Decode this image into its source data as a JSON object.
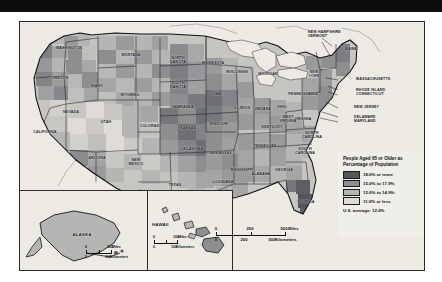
{
  "figure": {
    "kind": "choropleth-map",
    "subject": "People Aged 65 or Older as Percentage of Population"
  },
  "legend": {
    "title": "People Aged 65 or\nOlder as Percentage\nof Population",
    "classes": [
      {
        "label": "18.0% or more",
        "color": "#55565a"
      },
      {
        "label": "15.0% to 17.9%",
        "color": "#8d8e90"
      },
      {
        "label": "12.0% to 14.9%",
        "color": "#b5b5b4"
      },
      {
        "label": "11.9% or less",
        "color": "#dedcd5"
      }
    ],
    "average": "U.S. average: 12.6%"
  },
  "scales": {
    "main": {
      "miles": {
        "ticks": [
          "0",
          "250",
          "500"
        ],
        "unit": "Miles"
      },
      "kilometers": {
        "ticks": [
          "0",
          "250",
          "500"
        ],
        "unit": "Kilometers"
      }
    },
    "alaska": {
      "miles": {
        "ticks": [
          "0",
          "300"
        ],
        "unit": "Miles"
      },
      "kilometers": {
        "ticks": [
          "0",
          "300"
        ],
        "unit": "Kilometers"
      }
    },
    "hawaii": {
      "miles": {
        "ticks": [
          "0",
          "100"
        ],
        "unit": "Miles"
      },
      "kilometers": {
        "ticks": [
          "0",
          "100"
        ],
        "unit": "Kilometers"
      }
    }
  },
  "insets": {
    "alaska": {
      "name": "ALASKA"
    },
    "hawaii": {
      "name": "HAWAII"
    }
  },
  "chart_data": {
    "type": "heatmap",
    "title": "People Aged 65 or Older as Percentage of Population",
    "legend_position": "right",
    "grid": false,
    "classes": [
      "18.0% or more",
      "15.0% to 17.9%",
      "12.0% to 14.9%",
      "11.9% or less"
    ],
    "class_colors": [
      "#55565a",
      "#8d8e90",
      "#b5b5b4",
      "#dedcd5"
    ],
    "national_average": 12.6,
    "national_average_label": "U.S. average: 12.6%",
    "unit": "percent of population aged 65+"
  },
  "state_labels": [
    {
      "name": "WASHINGTON",
      "x": 49,
      "y": 26
    },
    {
      "name": "OREGON",
      "x": 40,
      "y": 56
    },
    {
      "name": "IDAHO",
      "x": 77,
      "y": 64
    },
    {
      "name": "MONTANA",
      "x": 111,
      "y": 33
    },
    {
      "name": "WYOMING",
      "x": 110,
      "y": 73
    },
    {
      "name": "NEVADA",
      "x": 51,
      "y": 90
    },
    {
      "name": "UTAH",
      "x": 86,
      "y": 100
    },
    {
      "name": "CALIFORNIA",
      "x": 25,
      "y": 110
    },
    {
      "name": "ARIZONA",
      "x": 77,
      "y": 136
    },
    {
      "name": "NEW\nMEXICO",
      "x": 116,
      "y": 140
    },
    {
      "name": "COLORADO",
      "x": 131,
      "y": 104
    },
    {
      "name": "NORTH\nDAKOTA",
      "x": 158,
      "y": 38
    },
    {
      "name": "SOUTH\nDAKOTA",
      "x": 158,
      "y": 63
    },
    {
      "name": "NEBRASKA",
      "x": 163,
      "y": 85
    },
    {
      "name": "KANSAS",
      "x": 168,
      "y": 106
    },
    {
      "name": "OKLAHOMA",
      "x": 172,
      "y": 127
    },
    {
      "name": "TEXAS",
      "x": 155,
      "y": 163
    },
    {
      "name": "MINNESOTA",
      "x": 193,
      "y": 41
    },
    {
      "name": "IOWA",
      "x": 196,
      "y": 72
    },
    {
      "name": "MISSOURI",
      "x": 199,
      "y": 102
    },
    {
      "name": "ARKANSAS",
      "x": 201,
      "y": 131
    },
    {
      "name": "LOUISIANA",
      "x": 203,
      "y": 160
    },
    {
      "name": "WISCONSIN",
      "x": 217,
      "y": 50
    },
    {
      "name": "ILLINOIS",
      "x": 222,
      "y": 86
    },
    {
      "name": "MICHIGAN",
      "x": 248,
      "y": 52
    },
    {
      "name": "INDIANA",
      "x": 243,
      "y": 87
    },
    {
      "name": "OHIO",
      "x": 262,
      "y": 85
    },
    {
      "name": "KENTUCKY",
      "x": 252,
      "y": 105
    },
    {
      "name": "TENNESSEE",
      "x": 245,
      "y": 124
    },
    {
      "name": "MISSISSIPPI",
      "x": 222,
      "y": 148
    },
    {
      "name": "ALABAMA",
      "x": 241,
      "y": 152
    },
    {
      "name": "GEORGIA",
      "x": 264,
      "y": 148
    },
    {
      "name": "FLORIDA",
      "x": 286,
      "y": 180
    },
    {
      "name": "SOUTH\nCAROLINA",
      "x": 285,
      "y": 129
    },
    {
      "name": "NORTH\nCAROLINA",
      "x": 292,
      "y": 113
    },
    {
      "name": "VIRGINIA",
      "x": 283,
      "y": 97
    },
    {
      "name": "WEST\nVIRGINIA",
      "x": 268,
      "y": 97
    },
    {
      "name": "PENNSYLVANIA",
      "x": 283,
      "y": 72
    },
    {
      "name": "NEW\nYORK",
      "x": 294,
      "y": 52
    },
    {
      "name": "MAINE",
      "x": 331,
      "y": 27
    }
  ],
  "callout_labels": [
    {
      "name": "NEW HAMPSHIRE\nVERMONT",
      "x": 288,
      "y": 12
    },
    {
      "name": "MASSACHUSETTS",
      "x": 336,
      "y": 57
    },
    {
      "name": "RHODE ISLAND\nCONNECTICUT",
      "x": 336,
      "y": 70
    },
    {
      "name": "NEW JERSEY",
      "x": 334,
      "y": 85
    },
    {
      "name": "DELAWARE\nMARYLAND",
      "x": 334,
      "y": 97
    }
  ]
}
